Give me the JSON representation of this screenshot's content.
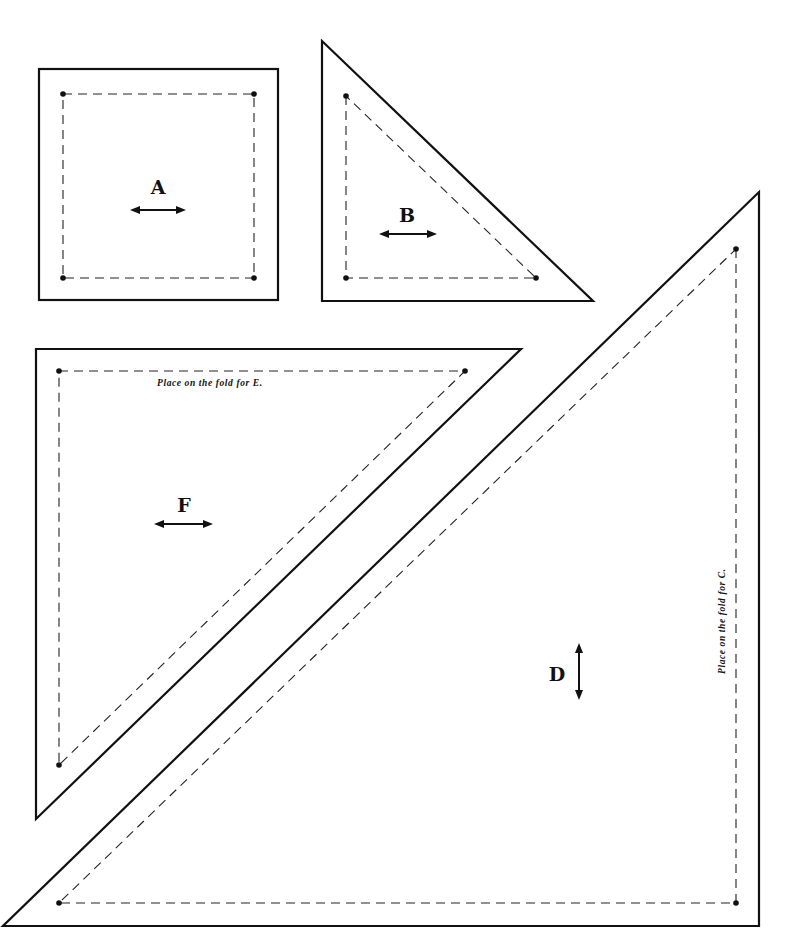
{
  "pieces": {
    "A": {
      "label": "A",
      "grainline": "horizontal"
    },
    "B": {
      "label": "B",
      "grainline": "horizontal"
    },
    "D": {
      "label": "D",
      "grainline": "vertical"
    },
    "F": {
      "label": "F",
      "grainline": "horizontal"
    }
  },
  "notes": {
    "fold_e": "Place on the fold for E.",
    "fold_c": "Place on the fold for C."
  },
  "colors": {
    "line": "#111111",
    "background": "#ffffff"
  }
}
